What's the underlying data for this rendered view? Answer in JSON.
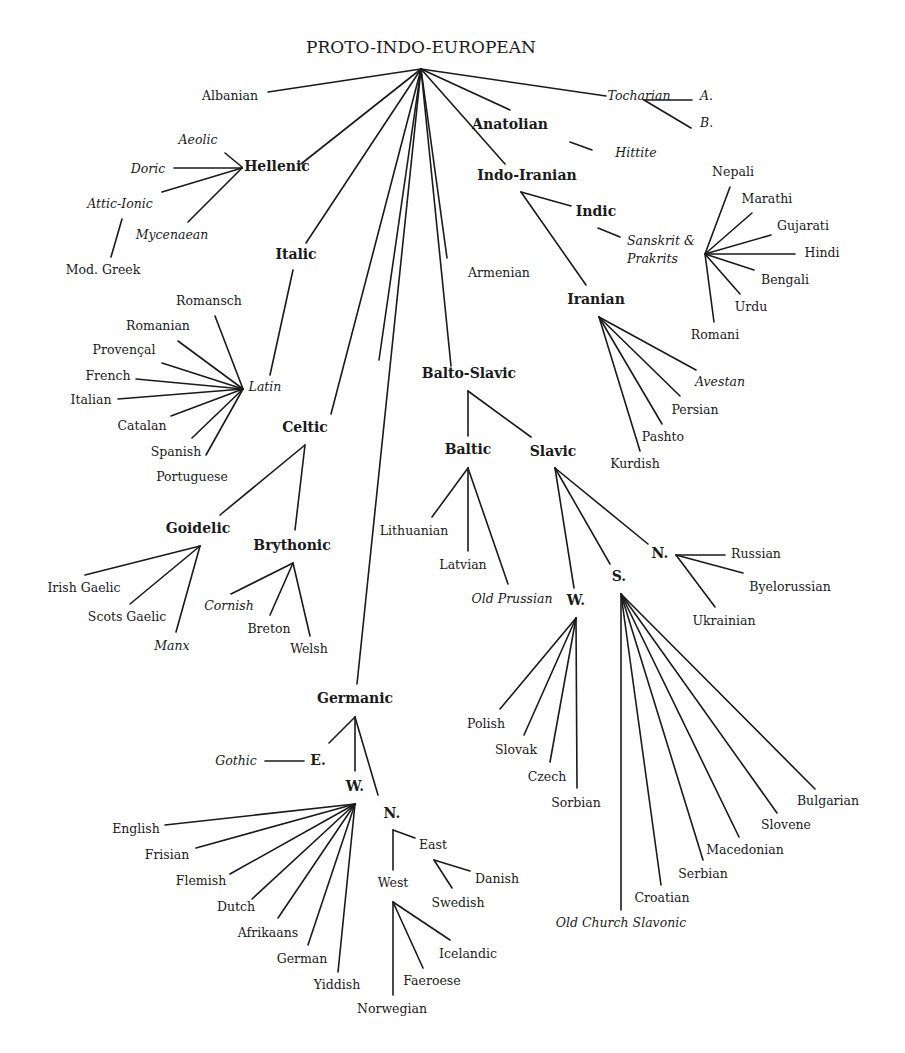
{
  "title": "PROTO-INDO-EUROPEAN",
  "colors": {
    "ink": "#1a1a1a",
    "background": "#ffffff"
  },
  "labels": [
    {
      "id": "pie",
      "text": "PROTO-INDO-EUROPEAN",
      "x": 421,
      "y": 53,
      "kind": "root",
      "anchor": "middle"
    },
    {
      "id": "albanian",
      "text": "Albanian",
      "x": 230,
      "y": 100,
      "kind": "lang",
      "anchor": "middle"
    },
    {
      "id": "tocharian",
      "text": "Tocharian",
      "x": 639,
      "y": 100,
      "kind": "lang",
      "italic": true,
      "anchor": "middle"
    },
    {
      "id": "toch-a",
      "text": "A.",
      "x": 700,
      "y": 100,
      "kind": "lang",
      "italic": true,
      "anchor": "start"
    },
    {
      "id": "toch-b",
      "text": "B.",
      "x": 700,
      "y": 127,
      "kind": "lang",
      "italic": true,
      "anchor": "start"
    },
    {
      "id": "anatolian",
      "text": "Anatolian",
      "x": 510,
      "y": 129,
      "kind": "group",
      "anchor": "middle"
    },
    {
      "id": "hittite",
      "text": "Hittite",
      "x": 636,
      "y": 157,
      "kind": "lang",
      "italic": true,
      "anchor": "middle"
    },
    {
      "id": "aeolic",
      "text": "Aeolic",
      "x": 198,
      "y": 144,
      "kind": "lang",
      "italic": true,
      "anchor": "middle"
    },
    {
      "id": "doric",
      "text": "Doric",
      "x": 148,
      "y": 173,
      "kind": "lang",
      "italic": true,
      "anchor": "middle"
    },
    {
      "id": "hellenic",
      "text": "Hellenic",
      "x": 277,
      "y": 171,
      "kind": "group",
      "anchor": "middle"
    },
    {
      "id": "attic-ionic",
      "text": "Attic-Ionic",
      "x": 120,
      "y": 208,
      "kind": "lang",
      "italic": true,
      "anchor": "middle"
    },
    {
      "id": "mycenaean",
      "text": "Mycenaean",
      "x": 172,
      "y": 239,
      "kind": "lang",
      "italic": true,
      "anchor": "middle"
    },
    {
      "id": "mod-greek",
      "text": "Mod. Greek",
      "x": 103,
      "y": 274,
      "kind": "lang",
      "anchor": "middle"
    },
    {
      "id": "indo-iranian",
      "text": "Indo-Iranian",
      "x": 527,
      "y": 180,
      "kind": "group",
      "anchor": "middle"
    },
    {
      "id": "indic",
      "text": "Indic",
      "x": 596,
      "y": 216,
      "kind": "group",
      "anchor": "middle"
    },
    {
      "id": "sanskrit-1",
      "text": "Sanskrit &",
      "x": 627,
      "y": 245,
      "kind": "lang",
      "italic": true,
      "anchor": "start"
    },
    {
      "id": "sanskrit-2",
      "text": "Prakrits",
      "x": 627,
      "y": 263,
      "kind": "lang",
      "italic": true,
      "anchor": "start"
    },
    {
      "id": "nepali",
      "text": "Nepali",
      "x": 733,
      "y": 176,
      "kind": "lang",
      "anchor": "middle"
    },
    {
      "id": "marathi",
      "text": "Marathi",
      "x": 767,
      "y": 203,
      "kind": "lang",
      "anchor": "middle"
    },
    {
      "id": "gujarati",
      "text": "Gujarati",
      "x": 803,
      "y": 230,
      "kind": "lang",
      "anchor": "middle"
    },
    {
      "id": "hindi",
      "text": "Hindi",
      "x": 822,
      "y": 257,
      "kind": "lang",
      "anchor": "middle"
    },
    {
      "id": "bengali",
      "text": "Bengali",
      "x": 785,
      "y": 284,
      "kind": "lang",
      "anchor": "middle"
    },
    {
      "id": "urdu",
      "text": "Urdu",
      "x": 751,
      "y": 311,
      "kind": "lang",
      "anchor": "middle"
    },
    {
      "id": "romani",
      "text": "Romani",
      "x": 715,
      "y": 339,
      "kind": "lang",
      "anchor": "middle"
    },
    {
      "id": "italic",
      "text": "Italic",
      "x": 296,
      "y": 259,
      "kind": "group",
      "anchor": "middle"
    },
    {
      "id": "armenian",
      "text": "Armenian",
      "x": 499,
      "y": 277,
      "kind": "lang",
      "anchor": "middle"
    },
    {
      "id": "iranian",
      "text": "Iranian",
      "x": 596,
      "y": 304,
      "kind": "group",
      "anchor": "middle"
    },
    {
      "id": "romansch",
      "text": "Romansch",
      "x": 209,
      "y": 305,
      "kind": "lang",
      "anchor": "middle"
    },
    {
      "id": "romanian",
      "text": "Romanian",
      "x": 158,
      "y": 330,
      "kind": "lang",
      "anchor": "middle"
    },
    {
      "id": "provencal",
      "text": "Provençal",
      "x": 124,
      "y": 354,
      "kind": "lang",
      "anchor": "middle"
    },
    {
      "id": "french",
      "text": "French",
      "x": 108,
      "y": 380,
      "kind": "lang",
      "anchor": "middle"
    },
    {
      "id": "latin",
      "text": "Latin",
      "x": 265,
      "y": 391,
      "kind": "lang",
      "italic": true,
      "anchor": "middle"
    },
    {
      "id": "italian",
      "text": "Italian",
      "x": 91,
      "y": 404,
      "kind": "lang",
      "anchor": "middle"
    },
    {
      "id": "catalan",
      "text": "Catalan",
      "x": 142,
      "y": 430,
      "kind": "lang",
      "anchor": "middle"
    },
    {
      "id": "spanish",
      "text": "Spanish",
      "x": 176,
      "y": 456,
      "kind": "lang",
      "anchor": "middle"
    },
    {
      "id": "portuguese",
      "text": "Portuguese",
      "x": 192,
      "y": 481,
      "kind": "lang",
      "anchor": "middle"
    },
    {
      "id": "balto-slavic",
      "text": "Balto-Slavic",
      "x": 469,
      "y": 378,
      "kind": "group",
      "anchor": "middle"
    },
    {
      "id": "avestan",
      "text": "Avestan",
      "x": 720,
      "y": 386,
      "kind": "lang",
      "italic": true,
      "anchor": "middle"
    },
    {
      "id": "persian",
      "text": "Persian",
      "x": 695,
      "y": 414,
      "kind": "lang",
      "anchor": "middle"
    },
    {
      "id": "pashto",
      "text": "Pashto",
      "x": 663,
      "y": 441,
      "kind": "lang",
      "anchor": "middle"
    },
    {
      "id": "kurdish",
      "text": "Kurdish",
      "x": 635,
      "y": 468,
      "kind": "lang",
      "anchor": "middle"
    },
    {
      "id": "celtic",
      "text": "Celtic",
      "x": 305,
      "y": 432,
      "kind": "group",
      "anchor": "middle"
    },
    {
      "id": "baltic",
      "text": "Baltic",
      "x": 468,
      "y": 454,
      "kind": "group",
      "anchor": "middle"
    },
    {
      "id": "slavic",
      "text": "Slavic",
      "x": 553,
      "y": 456,
      "kind": "group",
      "anchor": "middle"
    },
    {
      "id": "goidelic",
      "text": "Goidelic",
      "x": 198,
      "y": 533,
      "kind": "group",
      "anchor": "middle"
    },
    {
      "id": "brythonic",
      "text": "Brythonic",
      "x": 292,
      "y": 550,
      "kind": "group",
      "anchor": "middle"
    },
    {
      "id": "lithuanian",
      "text": "Lithuanian",
      "x": 414,
      "y": 535,
      "kind": "lang",
      "anchor": "middle"
    },
    {
      "id": "latvian",
      "text": "Latvian",
      "x": 463,
      "y": 569,
      "kind": "lang",
      "anchor": "middle"
    },
    {
      "id": "old-prussian",
      "text": "Old Prussian",
      "x": 512,
      "y": 603,
      "kind": "lang",
      "italic": true,
      "anchor": "middle"
    },
    {
      "id": "irish-gaelic",
      "text": "Irish Gaelic",
      "x": 84,
      "y": 592,
      "kind": "lang",
      "anchor": "middle"
    },
    {
      "id": "scots-gaelic",
      "text": "Scots Gaelic",
      "x": 127,
      "y": 621,
      "kind": "lang",
      "anchor": "middle"
    },
    {
      "id": "manx",
      "text": "Manx",
      "x": 172,
      "y": 650,
      "kind": "lang",
      "italic": true,
      "anchor": "middle"
    },
    {
      "id": "cornish",
      "text": "Cornish",
      "x": 229,
      "y": 610,
      "kind": "lang",
      "italic": true,
      "anchor": "middle"
    },
    {
      "id": "breton",
      "text": "Breton",
      "x": 269,
      "y": 633,
      "kind": "lang",
      "anchor": "middle"
    },
    {
      "id": "welsh",
      "text": "Welsh",
      "x": 309,
      "y": 653,
      "kind": "lang",
      "anchor": "middle"
    },
    {
      "id": "slavic-n",
      "text": "N.",
      "x": 660,
      "y": 558,
      "kind": "group",
      "anchor": "middle"
    },
    {
      "id": "russian",
      "text": "Russian",
      "x": 756,
      "y": 558,
      "kind": "lang",
      "anchor": "middle"
    },
    {
      "id": "byelorussian",
      "text": "Byelorussian",
      "x": 790,
      "y": 591,
      "kind": "lang",
      "anchor": "middle"
    },
    {
      "id": "ukrainian",
      "text": "Ukrainian",
      "x": 724,
      "y": 625,
      "kind": "lang",
      "anchor": "middle"
    },
    {
      "id": "slavic-s",
      "text": "S.",
      "x": 619,
      "y": 581,
      "kind": "group",
      "anchor": "middle"
    },
    {
      "id": "slavic-w",
      "text": "W.",
      "x": 576,
      "y": 605,
      "kind": "group",
      "anchor": "middle"
    },
    {
      "id": "polish",
      "text": "Polish",
      "x": 486,
      "y": 728,
      "kind": "lang",
      "anchor": "middle"
    },
    {
      "id": "slovak",
      "text": "Slovak",
      "x": 516,
      "y": 754,
      "kind": "lang",
      "anchor": "middle"
    },
    {
      "id": "czech",
      "text": "Czech",
      "x": 547,
      "y": 781,
      "kind": "lang",
      "anchor": "middle"
    },
    {
      "id": "sorbian",
      "text": "Sorbian",
      "x": 576,
      "y": 807,
      "kind": "lang",
      "anchor": "middle"
    },
    {
      "id": "bulgarian",
      "text": "Bulgarian",
      "x": 828,
      "y": 805,
      "kind": "lang",
      "anchor": "middle"
    },
    {
      "id": "slovene",
      "text": "Slovene",
      "x": 786,
      "y": 829,
      "kind": "lang",
      "anchor": "middle"
    },
    {
      "id": "macedonian",
      "text": "Macedonian",
      "x": 745,
      "y": 854,
      "kind": "lang",
      "anchor": "middle"
    },
    {
      "id": "serbian",
      "text": "Serbian",
      "x": 703,
      "y": 878,
      "kind": "lang",
      "anchor": "middle"
    },
    {
      "id": "croatian",
      "text": "Croatian",
      "x": 662,
      "y": 902,
      "kind": "lang",
      "anchor": "middle"
    },
    {
      "id": "old-church-slavonic",
      "text": "Old Church Slavonic",
      "x": 621,
      "y": 927,
      "kind": "lang",
      "italic": true,
      "anchor": "middle"
    },
    {
      "id": "germanic",
      "text": "Germanic",
      "x": 355,
      "y": 703,
      "kind": "group",
      "anchor": "middle"
    },
    {
      "id": "gothic",
      "text": "Gothic",
      "x": 236,
      "y": 765,
      "kind": "lang",
      "italic": true,
      "anchor": "middle"
    },
    {
      "id": "germ-e",
      "text": "E.",
      "x": 318,
      "y": 765,
      "kind": "group",
      "anchor": "middle"
    },
    {
      "id": "germ-w",
      "text": "W.",
      "x": 355,
      "y": 791,
      "kind": "group",
      "anchor": "middle"
    },
    {
      "id": "germ-n",
      "text": "N.",
      "x": 392,
      "y": 818,
      "kind": "group",
      "anchor": "middle"
    },
    {
      "id": "english",
      "text": "English",
      "x": 136,
      "y": 833,
      "kind": "lang",
      "anchor": "middle"
    },
    {
      "id": "frisian",
      "text": "Frisian",
      "x": 167,
      "y": 859,
      "kind": "lang",
      "anchor": "middle"
    },
    {
      "id": "flemish",
      "text": "Flemish",
      "x": 201,
      "y": 885,
      "kind": "lang",
      "anchor": "middle"
    },
    {
      "id": "dutch",
      "text": "Dutch",
      "x": 236,
      "y": 911,
      "kind": "lang",
      "anchor": "middle"
    },
    {
      "id": "afrikaans",
      "text": "Afrikaans",
      "x": 268,
      "y": 937,
      "kind": "lang",
      "anchor": "middle"
    },
    {
      "id": "german",
      "text": "German",
      "x": 302,
      "y": 963,
      "kind": "lang",
      "anchor": "middle"
    },
    {
      "id": "yiddish",
      "text": "Yiddish",
      "x": 337,
      "y": 989,
      "kind": "lang",
      "anchor": "middle"
    },
    {
      "id": "east",
      "text": "East",
      "x": 433,
      "y": 849,
      "kind": "lang",
      "anchor": "middle"
    },
    {
      "id": "danish",
      "text": "Danish",
      "x": 497,
      "y": 883,
      "kind": "lang",
      "anchor": "middle"
    },
    {
      "id": "swedish",
      "text": "Swedish",
      "x": 458,
      "y": 907,
      "kind": "lang",
      "anchor": "middle"
    },
    {
      "id": "west",
      "text": "West",
      "x": 393,
      "y": 887,
      "kind": "lang",
      "anchor": "middle"
    },
    {
      "id": "icelandic",
      "text": "Icelandic",
      "x": 468,
      "y": 958,
      "kind": "lang",
      "anchor": "middle"
    },
    {
      "id": "faeroese",
      "text": "Faeroese",
      "x": 432,
      "y": 985,
      "kind": "lang",
      "anchor": "middle"
    },
    {
      "id": "norwegian",
      "text": "Norwegian",
      "x": 392,
      "y": 1013,
      "kind": "lang",
      "anchor": "middle"
    }
  ],
  "edges": [
    [
      421,
      69,
      268,
      92
    ],
    [
      421,
      69,
      606,
      96
    ],
    [
      421,
      69,
      510,
      110
    ],
    [
      421,
      69,
      505,
      164
    ],
    [
      421,
      69,
      447,
      258
    ],
    [
      421,
      69,
      379,
      360
    ],
    [
      421,
      69,
      451,
      366
    ],
    [
      421,
      69,
      301,
      164
    ],
    [
      421,
      69,
      306,
      243
    ],
    [
      421,
      69,
      331,
      414
    ],
    [
      421,
      69,
      357,
      684
    ],
    [
      644,
      100,
      692,
      100
    ],
    [
      644,
      100,
      691,
      128
    ],
    [
      570,
      142,
      592,
      150
    ],
    [
      225,
      153,
      242,
      167
    ],
    [
      174,
      168,
      242,
      168
    ],
    [
      162,
      192,
      242,
      168
    ],
    [
      188,
      222,
      242,
      168
    ],
    [
      122,
      219,
      111,
      257
    ],
    [
      521,
      192,
      571,
      206
    ],
    [
      521,
      192,
      586,
      285
    ],
    [
      598,
      228,
      620,
      237
    ],
    [
      705,
      254,
      730,
      187
    ],
    [
      705,
      254,
      752,
      213
    ],
    [
      705,
      254,
      771,
      235
    ],
    [
      705,
      254,
      795,
      254
    ],
    [
      705,
      254,
      754,
      270
    ],
    [
      705,
      254,
      740,
      294
    ],
    [
      705,
      254,
      714,
      322
    ],
    [
      293,
      270,
      270,
      375
    ],
    [
      215,
      316,
      243,
      389
    ],
    [
      178,
      341,
      243,
      389
    ],
    [
      162,
      363,
      243,
      389
    ],
    [
      136,
      379,
      243,
      389
    ],
    [
      118,
      399,
      243,
      389
    ],
    [
      171,
      416,
      243,
      389
    ],
    [
      192,
      438,
      243,
      389
    ],
    [
      206,
      455,
      243,
      389
    ],
    [
      599,
      317,
      696,
      370
    ],
    [
      599,
      317,
      680,
      396
    ],
    [
      599,
      317,
      662,
      424
    ],
    [
      599,
      317,
      640,
      451
    ],
    [
      468,
      391,
      468,
      436
    ],
    [
      468,
      391,
      531,
      437
    ],
    [
      468,
      468,
      432,
      517
    ],
    [
      468,
      468,
      468,
      551
    ],
    [
      468,
      468,
      508,
      584
    ],
    [
      555,
      468,
      574,
      588
    ],
    [
      555,
      468,
      610,
      564
    ],
    [
      555,
      468,
      648,
      544
    ],
    [
      305,
      445,
      220,
      515
    ],
    [
      305,
      445,
      295,
      530
    ],
    [
      200,
      546,
      85,
      575
    ],
    [
      200,
      546,
      130,
      604
    ],
    [
      200,
      546,
      176,
      632
    ],
    [
      293,
      563,
      231,
      594
    ],
    [
      293,
      563,
      270,
      615
    ],
    [
      293,
      563,
      310,
      636
    ],
    [
      676,
      555,
      725,
      555
    ],
    [
      676,
      555,
      743,
      573
    ],
    [
      676,
      555,
      715,
      607
    ],
    [
      576,
      618,
      500,
      709
    ],
    [
      576,
      618,
      524,
      735
    ],
    [
      576,
      618,
      550,
      762
    ],
    [
      576,
      618,
      577,
      788
    ],
    [
      621,
      594,
      621,
      910
    ],
    [
      621,
      594,
      661,
      885
    ],
    [
      621,
      594,
      703,
      860
    ],
    [
      621,
      594,
      739,
      837
    ],
    [
      621,
      594,
      777,
      813
    ],
    [
      621,
      594,
      815,
      789
    ],
    [
      355,
      717,
      329,
      743
    ],
    [
      355,
      717,
      355,
      771
    ],
    [
      355,
      717,
      378,
      795
    ],
    [
      265,
      761,
      304,
      761
    ],
    [
      355,
      804,
      165,
      825
    ],
    [
      355,
      804,
      196,
      848
    ],
    [
      355,
      804,
      230,
      874
    ],
    [
      355,
      804,
      252,
      899
    ],
    [
      355,
      804,
      278,
      918
    ],
    [
      355,
      804,
      308,
      945
    ],
    [
      355,
      804,
      338,
      972
    ],
    [
      393,
      830,
      393,
      870
    ],
    [
      393,
      830,
      415,
      838
    ],
    [
      434,
      860,
      470,
      871
    ],
    [
      434,
      860,
      452,
      888
    ],
    [
      393,
      902,
      393,
      995
    ],
    [
      393,
      902,
      423,
      968
    ],
    [
      393,
      902,
      450,
      940
    ]
  ]
}
